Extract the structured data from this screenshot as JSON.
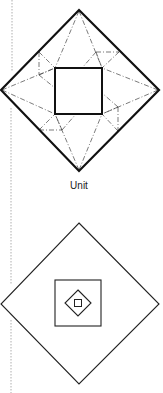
{
  "figure": {
    "caption": "Unit",
    "colors": {
      "line": "#111111",
      "crease": "#444444",
      "margin_guide": "#9a9a9a",
      "background": "#ffffff"
    },
    "diagrams": [
      {
        "name": "unit-fold-pattern",
        "outer_shape": "diamond",
        "inner_shape": "square",
        "crease_style": "dash-dot"
      },
      {
        "name": "nested-squares",
        "shapes": [
          "outer diamond",
          "square",
          "small diamond",
          "tiny square"
        ]
      }
    ]
  }
}
